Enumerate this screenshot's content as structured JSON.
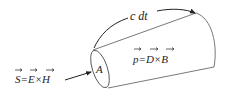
{
  "diagram": {
    "labels": {
      "poynting": "S=E×H",
      "poynting_vectors": [
        "S",
        "E",
        "H"
      ],
      "momentum": "p=D×B",
      "momentum_vectors": [
        "p",
        "D",
        "B"
      ],
      "area": "A",
      "length": "c dt"
    },
    "colors": {
      "stroke": "#222222",
      "thin_stroke": "#555555",
      "background": "#ffffff"
    }
  }
}
